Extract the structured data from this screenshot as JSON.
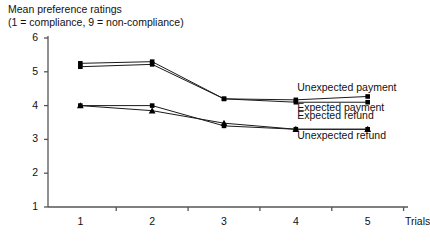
{
  "chart_data": {
    "type": "line",
    "title": "Mean preference ratings\n(1 = compliance, 9 = non-compliance)",
    "title_lines": [
      "Mean preference ratings",
      "(1 = compliance, 9 = non-compliance)"
    ],
    "xlabel": "Trials",
    "ylabel": "",
    "x": [
      1,
      2,
      3,
      4,
      5
    ],
    "categories": [
      "1",
      "2",
      "3",
      "4",
      "5"
    ],
    "xtick_labels": [
      "1",
      "2",
      "3",
      "4",
      "5"
    ],
    "ytick_labels": [
      "1",
      "2",
      "3",
      "4",
      "5",
      "6"
    ],
    "yticks": [
      1,
      2,
      3,
      4,
      5,
      6
    ],
    "ylim": [
      1,
      6
    ],
    "xlim": [
      0.55,
      5.45
    ],
    "grid": false,
    "legend_position": "inline-right",
    "series": [
      {
        "name": "Unexpected payment",
        "marker": "square",
        "values": [
          5.25,
          5.3,
          4.2,
          4.17,
          4.27
        ]
      },
      {
        "name": "Expected payment",
        "marker": "square",
        "values": [
          5.15,
          5.22,
          4.2,
          4.1,
          4.1
        ]
      },
      {
        "name": "Expected refund",
        "marker": "triangle",
        "values": [
          4.0,
          3.85,
          3.48,
          3.3,
          3.3
        ]
      },
      {
        "name": "Unexpected refund",
        "marker": "square",
        "values": [
          4.0,
          4.0,
          3.4,
          3.3,
          3.3
        ]
      }
    ],
    "annotations": [
      {
        "text": "Unexpected payment",
        "x": 4.02,
        "y": 4.52
      },
      {
        "text": "Expected payment",
        "x": 4.02,
        "y": 3.92
      },
      {
        "text": "Expected refund",
        "x": 4.02,
        "y": 3.7
      },
      {
        "text": "Unexpected refund",
        "x": 4.02,
        "y": 3.1
      }
    ],
    "colors": {
      "line": "#1a1a1a",
      "marker": "#000000",
      "axis": "#555555",
      "text": "#111111",
      "background": "#ffffff"
    }
  }
}
